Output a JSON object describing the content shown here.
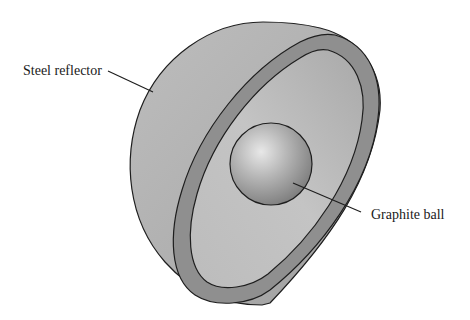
{
  "diagram": {
    "type": "cutaway-3d-illustration",
    "components": [
      {
        "id": "reflector",
        "label": "Steel reflector"
      },
      {
        "id": "ball",
        "label": "Graphite ball"
      }
    ]
  },
  "labels": {
    "steel_reflector": "Steel reflector",
    "graphite_ball": "Graphite ball"
  },
  "colors": {
    "outer_shell": "#b4b4b4",
    "rim": "#8f8f8f",
    "inner_cavity": "#c2c2c2",
    "sphere_highlight": "#e6e6e6",
    "sphere_shadow": "#7a7a7a",
    "outline": "#1e1e1e"
  }
}
